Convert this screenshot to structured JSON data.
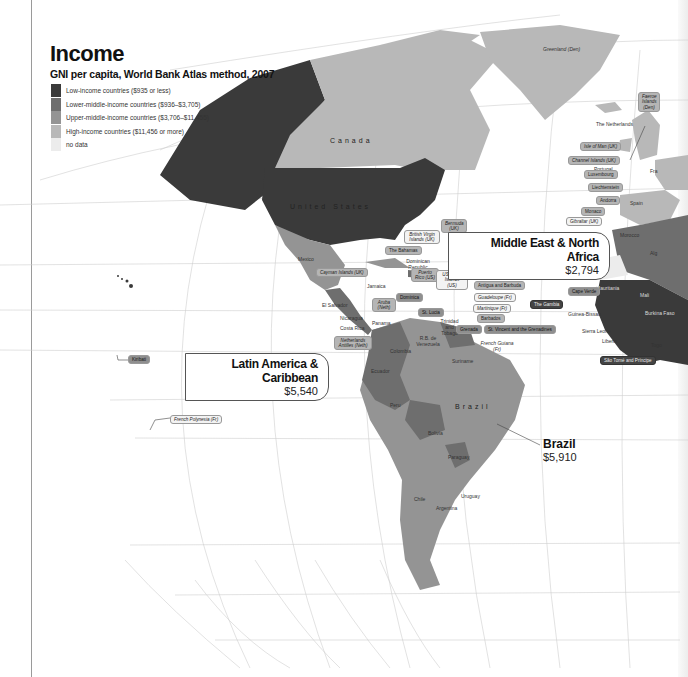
{
  "header": {
    "title": "Income",
    "subtitle": "GNI per capita, World Bank Atlas method, 2007"
  },
  "legend": [
    {
      "label": "Low-income countries ($935 or less)",
      "color": "#3a3a3a"
    },
    {
      "label": "Lower-middle-income countries ($936–$3,705)",
      "color": "#6e6e6e"
    },
    {
      "label": "Upper-middle-income countries ($3,706–$11,455)",
      "color": "#949494"
    },
    {
      "label": "High-income countries ($11,456 or more)",
      "color": "#b8b8b8"
    },
    {
      "label": "no data",
      "color": "#ececec"
    }
  ],
  "callouts": {
    "mena": {
      "name": "Middle East & North Africa",
      "value": "$2,794"
    },
    "lac": {
      "name": "Latin America & Caribbean",
      "value": "$5,540"
    },
    "brazil": {
      "name": "Brazil",
      "value": "$5,910"
    }
  },
  "countries": {
    "canada": "Canada",
    "usa": "United States",
    "brazil": "Brazil",
    "greenland": "Greenland (Den)",
    "mexico": "Mexico",
    "cuba": "Cuba",
    "jamaica": "Jamaica",
    "haiti": "Haiti",
    "dominican_republic": "Dominican Republic",
    "belize": "Belize",
    "guatemala": "Guatemala",
    "honduras": "Honduras",
    "el_salvador": "El Salvador",
    "nicaragua": "Nicaragua",
    "costa_rica": "Costa Rica",
    "panama": "Panama",
    "colombia": "Colombia",
    "venezuela": "R.B. de Venezuela",
    "guyana": "Guyana",
    "suriname": "Suriname",
    "ecuador": "Ecuador",
    "peru": "Peru",
    "bolivia": "Bolivia",
    "paraguay": "Paraguay",
    "chile": "Chile",
    "argentina": "Argentina",
    "uruguay": "Uruguay",
    "trinidad": "Trinidad and Tobago",
    "spain": "Spain",
    "portugal": "Portugal",
    "morocco": "Morocco",
    "algeria": "Alg",
    "mali": "Mali",
    "mauritania": "Mauritania",
    "former_spanish_sahara": "Former Spanish Sahara",
    "burkina_faso": "Burkina Faso",
    "guinea_bissau": "Guinea-Bissau",
    "sierra_leone": "Sierra Leone",
    "liberia": "Liberia",
    "togo": "Togo",
    "netherlands": "The Netherlands",
    "france": "Fra"
  },
  "island_labels": {
    "faeroe": "Faeroe Islands (Den)",
    "isle_of_man": "Isle of Man (UK)",
    "channel_islands": "Channel Islands (UK)",
    "luxembourg": "Luxembourg",
    "liechtenstein": "Liechtenstein",
    "andorra": "Andorra",
    "monaco": "Monaco",
    "gibraltar": "Gibraltar (UK)",
    "bermuda": "Bermuda (UK)",
    "bvi": "British Virgin Islands (UK)",
    "bahamas": "The Bahamas",
    "cayman": "Cayman Islands (UK)",
    "puerto_rico": "Puerto Rico (US)",
    "usvi": "US Virgin Islands (US)",
    "st_kitts": "St. Kitts and Nevis",
    "antigua": "Antigua and Barbuda",
    "guadeloupe": "Guadeloupe (Fr)",
    "martinique": "Martinique (Fr)",
    "barbados": "Barbados",
    "st_vincent": "St. Vincent and the Grenadines",
    "grenada": "Grenada",
    "st_lucia": "St. Lucia",
    "dominica": "Dominica",
    "aruba": "Aruba (Neth)",
    "neth_antilles": "Netherlands Antilles (Neth)",
    "french_guiana": "French Guiana (Fr)",
    "cape_verde": "Cape Verde",
    "the_gambia": "The Gambia",
    "sao_tome": "São Tomé and Príncipe",
    "kiribati": "Kiribati",
    "french_polynesia": "French Polynesia (Fr)"
  }
}
